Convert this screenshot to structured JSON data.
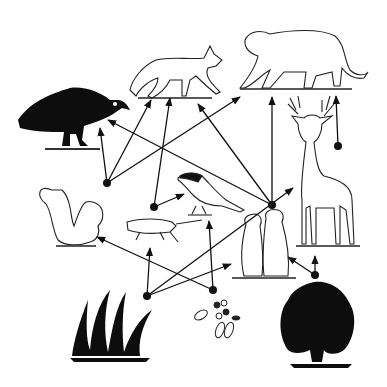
{
  "diagram": {
    "title": "",
    "type": "food-web",
    "colors": {
      "ink": "#111111",
      "fill_dark": "#0d0d0d",
      "fill_light": "#ffffff",
      "background": "#ffffff"
    },
    "organisms": [
      {
        "id": "vulture",
        "name": "Turkey vulture",
        "x": 70,
        "y": 118,
        "style": "dark"
      },
      {
        "id": "coyote",
        "name": "Coyote",
        "x": 175,
        "y": 75,
        "style": "light"
      },
      {
        "id": "cougar",
        "name": "Cougar",
        "x": 295,
        "y": 65,
        "style": "light"
      },
      {
        "id": "deer",
        "name": "White-tailed deer",
        "x": 323,
        "y": 180,
        "style": "light"
      },
      {
        "id": "squirrel",
        "name": "Squirrel",
        "x": 70,
        "y": 215,
        "style": "light"
      },
      {
        "id": "grasshopper",
        "name": "Grasshopper",
        "x": 155,
        "y": 230,
        "style": "light"
      },
      {
        "id": "bird",
        "name": "Bird",
        "x": 208,
        "y": 192,
        "style": "mixed"
      },
      {
        "id": "prairie_dogs",
        "name": "Prairie dogs",
        "x": 258,
        "y": 242,
        "style": "light"
      },
      {
        "id": "grass",
        "name": "Grass",
        "x": 113,
        "y": 325,
        "style": "dark"
      },
      {
        "id": "seeds",
        "name": "Seeds",
        "x": 218,
        "y": 330,
        "style": "light"
      },
      {
        "id": "bush",
        "name": "Shrub",
        "x": 320,
        "y": 320,
        "style": "dark"
      }
    ],
    "nodes": [
      {
        "id": "n_squirrel",
        "x": 107,
        "y": 183,
        "arrows": [
          [
            100,
            128
          ],
          [
            151,
            100
          ],
          [
            240,
            97
          ]
        ]
      },
      {
        "id": "n_grasshopper",
        "x": 154,
        "y": 207,
        "arrows": [
          [
            170,
            98
          ],
          [
            184,
            194
          ]
        ]
      },
      {
        "id": "n_prairie",
        "x": 272,
        "y": 205,
        "arrows": [
          [
            198,
            104
          ],
          [
            108,
            120
          ],
          [
            272,
            97
          ]
        ]
      },
      {
        "id": "n_deer",
        "x": 338,
        "y": 146,
        "arrows": [
          [
            336,
            96
          ]
        ]
      },
      {
        "id": "n_grass",
        "x": 147,
        "y": 296,
        "arrows": [
          [
            150,
            248
          ],
          [
            293,
            188
          ],
          [
            231,
            264
          ]
        ]
      },
      {
        "id": "n_seeds",
        "x": 213,
        "y": 290,
        "arrows": [
          [
            97,
            237
          ],
          [
            209,
            221
          ]
        ]
      },
      {
        "id": "n_bush",
        "x": 315,
        "y": 275,
        "arrows": [
          [
            315,
            256
          ],
          [
            288,
            257
          ]
        ]
      }
    ]
  }
}
